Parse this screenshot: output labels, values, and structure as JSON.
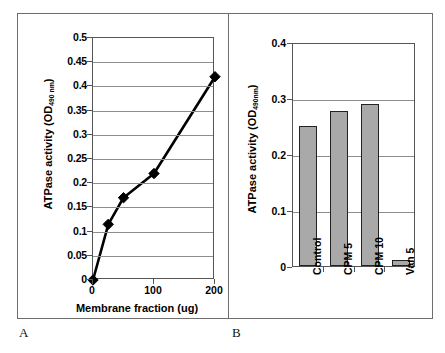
{
  "figure": {
    "panel_a_letter": "A",
    "panel_b_letter": "B"
  },
  "chart_data": [
    {
      "type": "line",
      "panel": "A",
      "title": "",
      "xlabel": "Membrane fraction (ug)",
      "ylabel_main": "ATPase activity (OD",
      "ylabel_sub": "490 nm",
      "ylabel_close": ")",
      "x": [
        0,
        25,
        50,
        100,
        200
      ],
      "values": [
        0,
        0.115,
        0.17,
        0.22,
        0.42
      ],
      "xlim": [
        0,
        200
      ],
      "ylim": [
        0,
        0.5
      ],
      "xticks": [
        "0",
        "100",
        "200"
      ],
      "xtick_values": [
        0,
        100,
        200
      ],
      "yticks": [
        "0",
        "0.05",
        "0.1",
        "0.15",
        "0.2",
        "0.25",
        "0.3",
        "0.35",
        "0.4",
        "0.45",
        "0.5"
      ],
      "ytick_values": [
        0,
        0.05,
        0.1,
        0.15,
        0.2,
        0.25,
        0.3,
        0.35,
        0.4,
        0.45,
        0.5
      ],
      "grid": "horizontal",
      "legend": "none",
      "marker": "diamond",
      "line_color": "#000000",
      "marker_color": "#000000"
    },
    {
      "type": "bar",
      "panel": "B",
      "title": "",
      "xlabel": "",
      "ylabel_main": "ATPase activity (OD",
      "ylabel_sub": "490nm",
      "ylabel_close": ")",
      "categories": [
        "Control",
        "CPM 5",
        "CPM 10",
        "Van 5"
      ],
      "values": [
        0.25,
        0.277,
        0.289,
        0.01
      ],
      "ylim": [
        0,
        0.4
      ],
      "yticks": [
        "0",
        "0.1",
        "0.2",
        "0.3",
        "0.4"
      ],
      "ytick_values": [
        0,
        0.1,
        0.2,
        0.3,
        0.4
      ],
      "grid": "horizontal",
      "legend": "none",
      "bar_color": "#a9a9a9",
      "bar_edge_color": "#222222"
    }
  ]
}
